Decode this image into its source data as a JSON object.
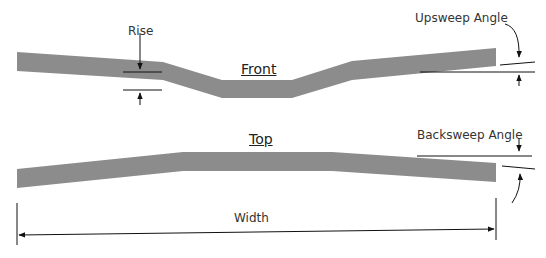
{
  "diagram": {
    "views": {
      "front_title": "Front",
      "top_title": "Top"
    },
    "labels": {
      "rise": "Rise",
      "upsweep": "Upsweep Angle",
      "backsweep": "Backsweep Angle",
      "width": "Width"
    },
    "colors": {
      "bar_fill": "#8c8c8c",
      "line": "#111111",
      "text": "#333333"
    }
  }
}
